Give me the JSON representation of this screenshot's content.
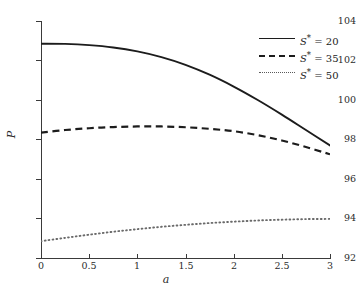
{
  "chart_data": {
    "type": "line",
    "title": "",
    "xlabel": "a",
    "ylabel": "P",
    "xlim": [
      0,
      3
    ],
    "ylim": [
      92,
      104
    ],
    "xticks": [
      "0",
      "0.5",
      "1",
      "1.5",
      "2",
      "2.5",
      "3"
    ],
    "xtick_values": [
      0,
      0.5,
      1,
      1.5,
      2,
      2.5,
      3
    ],
    "yticks": [
      "92",
      "94",
      "96",
      "98",
      "100",
      "102",
      "104"
    ],
    "ytick_values": [
      92,
      94,
      96,
      98,
      100,
      102,
      104
    ],
    "grid": false,
    "legend_position": "top-right",
    "x": [
      0,
      0.25,
      0.5,
      0.75,
      1,
      1.25,
      1.5,
      1.75,
      2,
      2.25,
      2.5,
      2.75,
      3
    ],
    "series": [
      {
        "name": "S* = 20",
        "label_symbol": "S",
        "label_star": "*",
        "label_value": "20",
        "style": "solid",
        "color": "#1c1c1c",
        "values": [
          102.85,
          102.84,
          102.78,
          102.66,
          102.46,
          102.17,
          101.78,
          101.28,
          100.68,
          100.0,
          99.26,
          98.48,
          97.7
        ]
      },
      {
        "name": "S* = 35",
        "label_symbol": "S",
        "label_star": "*",
        "label_value": "35",
        "style": "dashed",
        "color": "#1c1c1c",
        "values": [
          98.35,
          98.48,
          98.57,
          98.63,
          98.66,
          98.66,
          98.62,
          98.54,
          98.42,
          98.22,
          97.95,
          97.62,
          97.25
        ]
      },
      {
        "name": "S* = 50",
        "label_symbol": "S",
        "label_star": "*",
        "label_value": "50",
        "style": "dotted",
        "color": "#5a5a5a",
        "values": [
          92.85,
          93.02,
          93.18,
          93.33,
          93.46,
          93.58,
          93.68,
          93.77,
          93.84,
          93.9,
          93.94,
          93.97,
          93.98
        ]
      }
    ]
  }
}
